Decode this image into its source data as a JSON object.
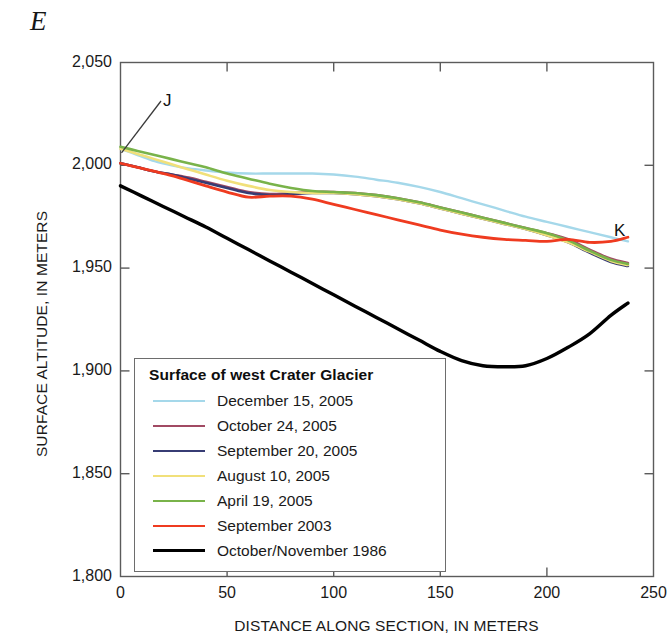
{
  "figure": {
    "section_label": "E",
    "point_labels": {
      "left": "J",
      "right": "K"
    }
  },
  "chart_data": {
    "type": "line",
    "title": "",
    "xlabel": "DISTANCE ALONG SECTION, IN METERS",
    "ylabel": "SURFACE ALTITUDE, IN METERS",
    "xlim": [
      0,
      250
    ],
    "ylim": [
      1800,
      2050
    ],
    "xticks": [
      0,
      50,
      100,
      150,
      200,
      250
    ],
    "yticks": [
      1800,
      1850,
      1900,
      1950,
      2000,
      2050
    ],
    "xtick_labels": [
      "0",
      "50",
      "100",
      "150",
      "200",
      "250"
    ],
    "ytick_labels": [
      "1,800",
      "1,850",
      "1,900",
      "1,950",
      "2,000",
      "2,050"
    ],
    "grid": false,
    "legend_position": "lower-left-inside",
    "legend_title": "Surface of west Crater Glacier",
    "series": [
      {
        "name": "December 15, 2005",
        "color": "#a5d8ea",
        "width": 2.4,
        "x": [
          0,
          8,
          16,
          24,
          32,
          40,
          50,
          60,
          70,
          80,
          90,
          100,
          110,
          120,
          130,
          140,
          150,
          160,
          170,
          180,
          190,
          200,
          210,
          220,
          230,
          238
        ],
        "y": [
          2008,
          2005,
          2002,
          2000,
          1998.5,
          1997.5,
          1996.5,
          1996,
          1996,
          1996,
          1996,
          1995.5,
          1994.5,
          1993,
          1991.5,
          1989.5,
          1987,
          1984,
          1981,
          1978,
          1975,
          1972.5,
          1970,
          1967.5,
          1965,
          1963
        ]
      },
      {
        "name": "October 24, 2005",
        "color": "#a14a63",
        "width": 2.6,
        "x": [
          0,
          8,
          16,
          24,
          32,
          40,
          50,
          60,
          70,
          80,
          90,
          100,
          110,
          120,
          130,
          140,
          150,
          160,
          170,
          180,
          190,
          200,
          210,
          220,
          230,
          238
        ],
        "y": [
          2001,
          1999,
          1997,
          1995.5,
          1994,
          1992,
          1989.5,
          1987,
          1986,
          1986.5,
          1987,
          1987,
          1986.5,
          1985.5,
          1984,
          1982,
          1979.5,
          1977,
          1974.5,
          1972,
          1969.5,
          1967,
          1964,
          1959,
          1954.5,
          1952.5
        ]
      },
      {
        "name": "September 20, 2005",
        "color": "#373c74",
        "width": 2.6,
        "x": [
          0,
          8,
          16,
          24,
          32,
          40,
          50,
          60,
          70,
          80,
          90,
          100,
          110,
          120,
          130,
          140,
          150,
          160,
          170,
          180,
          190,
          200,
          210,
          220,
          230,
          238
        ],
        "y": [
          2001,
          1999,
          1997,
          1995.5,
          1993.5,
          1991.5,
          1989,
          1986.5,
          1985.5,
          1986,
          1986.5,
          1986.5,
          1986,
          1985,
          1983.5,
          1981.5,
          1979,
          1976.5,
          1974,
          1971.5,
          1969,
          1966,
          1962.5,
          1957.5,
          1953,
          1951
        ]
      },
      {
        "name": "August 10, 2005",
        "color": "#f1e07a",
        "width": 2.6,
        "x": [
          0,
          8,
          16,
          24,
          32,
          40,
          50,
          60,
          70,
          80,
          90,
          100,
          110,
          120,
          130,
          140,
          150,
          160,
          170,
          180,
          190,
          200,
          210,
          220,
          230,
          238
        ],
        "y": [
          2008,
          2005.5,
          2003,
          2000.5,
          1998,
          1995.5,
          1992.5,
          1990,
          1988,
          1987,
          1986.5,
          1986.5,
          1986,
          1985,
          1983.5,
          1981.5,
          1979,
          1976.5,
          1974,
          1971.5,
          1969,
          1966,
          1962.5,
          1958,
          1953.5,
          1951.5
        ]
      },
      {
        "name": "April 19, 2005",
        "color": "#79b34a",
        "width": 2.6,
        "x": [
          0,
          8,
          16,
          24,
          32,
          40,
          50,
          60,
          70,
          80,
          90,
          100,
          110,
          120,
          130,
          140,
          150,
          160,
          170,
          180,
          190,
          200,
          210,
          220,
          230,
          238
        ],
        "y": [
          2009,
          2007,
          2005,
          2003,
          2001,
          1999,
          1996,
          1993.5,
          1991,
          1989,
          1987.5,
          1987,
          1986.5,
          1985.5,
          1984,
          1982,
          1979.5,
          1977,
          1974.5,
          1972,
          1969.5,
          1967,
          1963.5,
          1958.5,
          1954,
          1952
        ]
      },
      {
        "name": "September 2003",
        "color": "#ef3b20",
        "width": 2.8,
        "x": [
          0,
          8,
          16,
          24,
          32,
          40,
          50,
          60,
          70,
          80,
          90,
          100,
          110,
          120,
          130,
          140,
          150,
          160,
          170,
          180,
          190,
          200,
          210,
          220,
          230,
          238
        ],
        "y": [
          2001,
          1999,
          1997,
          1995,
          1992.5,
          1990,
          1987,
          1984.5,
          1985,
          1985,
          1983.5,
          1981,
          1978.5,
          1976,
          1973.5,
          1971,
          1968.5,
          1966.5,
          1965,
          1964,
          1963.5,
          1963,
          1964,
          1962.5,
          1963,
          1965
        ]
      },
      {
        "name": "October/November 1986",
        "color": "#000000",
        "width": 3.4,
        "x": [
          0,
          10,
          20,
          30,
          40,
          50,
          60,
          70,
          80,
          90,
          100,
          110,
          120,
          130,
          140,
          150,
          160,
          170,
          180,
          190,
          200,
          210,
          220,
          230,
          238
        ],
        "y": [
          1990,
          1985,
          1980,
          1975,
          1970,
          1964.5,
          1959,
          1953.5,
          1948,
          1942.5,
          1937,
          1931.5,
          1926,
          1920.5,
          1915,
          1909.5,
          1905,
          1902.5,
          1902,
          1902.5,
          1906,
          1911.5,
          1918,
          1927,
          1933
        ]
      }
    ]
  }
}
